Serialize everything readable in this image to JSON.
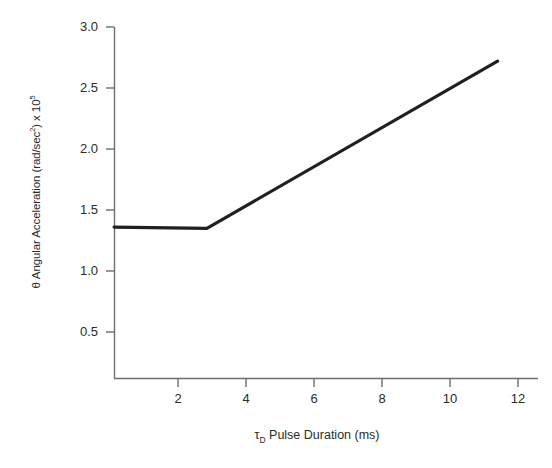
{
  "chart_data": {
    "type": "line",
    "title": "",
    "subtitle": "",
    "xlabel_prefix": "τ",
    "xlabel_sub": "D",
    "xlabel_rest": " Pulse Duration (ms)",
    "xlabel_full": "τD Pulse Duration (ms)",
    "ylabel_prefix": "θ Angular Acceleration (rad/sec",
    "ylabel_sup1": "2",
    "ylabel_mid": ") x 10",
    "ylabel_sup2": "5",
    "ylabel_full": "θ Angular Acceleration (rad/sec2) x 105",
    "xlim": [
      0,
      12.3
    ],
    "ylim": [
      0,
      3.15
    ],
    "xticks": [
      2,
      4,
      6,
      8,
      10,
      12
    ],
    "xtick_labels": [
      "2",
      "4",
      "6",
      "8",
      "10",
      "12"
    ],
    "yticks": [
      0.5,
      1.0,
      1.5,
      2.0,
      2.5,
      3.0
    ],
    "ytick_labels": [
      "0.5",
      "1.0",
      "1.5",
      "2.0",
      "2.5",
      "3.0"
    ],
    "grid": false,
    "legend": null,
    "axis_spines": [
      "left",
      "bottom"
    ],
    "series": [
      {
        "name": "angular acceleration",
        "color": "#221f1f",
        "linewidth": 3.2,
        "x": [
          0.12,
          2.85,
          11.4
        ],
        "y": [
          1.36,
          1.35,
          2.72
        ],
        "breakpoint": {
          "x": 2.85,
          "y": 1.35
        },
        "plateau_value": 1.36,
        "endpoint": {
          "x": 11.4,
          "y": 2.72
        }
      }
    ]
  },
  "figure": {
    "background": "#ffffff",
    "axis_color": "#6e6e6e",
    "text_color": "#2b2b2b",
    "line_color": "#221f1f"
  }
}
